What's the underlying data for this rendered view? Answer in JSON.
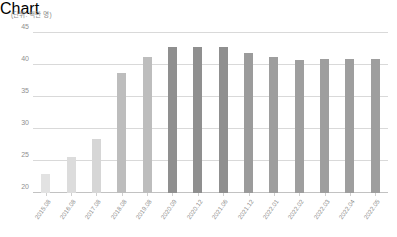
{
  "chart_data": {
    "type": "bar",
    "title": "",
    "subtitle": "",
    "unit_label": "(단위: 백만 명)",
    "xlabel": "",
    "ylabel": "",
    "ylim": [
      20,
      45
    ],
    "yticks": [
      20,
      25,
      30,
      35,
      40,
      45
    ],
    "grid": true,
    "legend": "none",
    "categories": [
      "2015.08",
      "2016.08",
      "2017.08",
      "2018.08",
      "2019.08",
      "2020.09",
      "2020.12",
      "2021.06",
      "2021.12",
      "2022.01",
      "2022.02",
      "2022.03",
      "2022.04",
      "2022.05"
    ],
    "values": [
      23.0,
      25.7,
      28.5,
      38.7,
      41.2,
      42.8,
      42.8,
      42.8,
      41.8,
      41.3,
      40.8,
      41.0,
      40.9,
      40.9
    ],
    "bar_colors": [
      "#e2e2e2",
      "#dcdcdc",
      "#d6d6d6",
      "#bdbdbd",
      "#bdbdbd",
      "#8f8f8f",
      "#8f8f8f",
      "#8f8f8f",
      "#9b9b9b",
      "#9e9e9e",
      "#9e9e9e",
      "#9e9e9e",
      "#9e9e9e",
      "#9e9e9e"
    ]
  },
  "colors": {
    "grid": "#d9d9d9",
    "axis": "#c2c2c2",
    "tick_text": "#8f8f8f",
    "background": "#ffffff"
  }
}
